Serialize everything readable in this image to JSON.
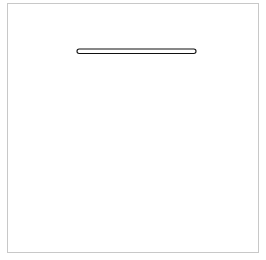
{
  "diagram": {
    "top": {
      "label": "correct",
      "loop_count": 12,
      "shape": "straight"
    },
    "bottom": {
      "label": "incorrect",
      "loop_count": 21,
      "shape": "arc"
    },
    "colors": {
      "stroke": "#111111",
      "border": "#c8c8c8",
      "background": "#ffffff"
    }
  }
}
